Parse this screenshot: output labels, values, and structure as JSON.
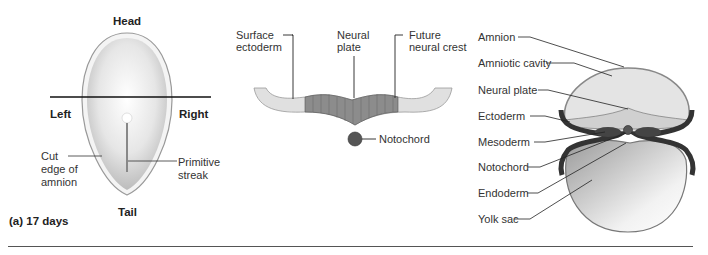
{
  "panel_a": {
    "orientation": {
      "head": "Head",
      "tail": "Tail",
      "left": "Left",
      "right": "Right"
    },
    "labels": {
      "cut_edge": "Cut\nedge of\namnion",
      "cut_edge_lines": [
        "Cut",
        "edge of",
        "amnion"
      ],
      "primitive_streak_lines": [
        "Primitive",
        "streak"
      ]
    },
    "caption": "(a) 17 days"
  },
  "panel_b": {
    "labels": {
      "surface_ectoderm_lines": [
        "Surface",
        "ectoderm"
      ],
      "neural_plate_lines": [
        "Neural",
        "plate"
      ],
      "future_neural_crest_lines": [
        "Future",
        "neural crest"
      ],
      "notochord": "Notochord"
    }
  },
  "panel_c": {
    "labels": [
      "Amnion",
      "Amniotic cavity",
      "Neural plate",
      "Ectoderm",
      "Mesoderm",
      "Notochord",
      "Endoderm",
      "Yolk sac"
    ]
  },
  "colors": {
    "line": "#222222",
    "plate_dark": "#8a8a8a",
    "plate_light": "#d8d8d8",
    "tissue_dark": "#3a3a3a"
  }
}
